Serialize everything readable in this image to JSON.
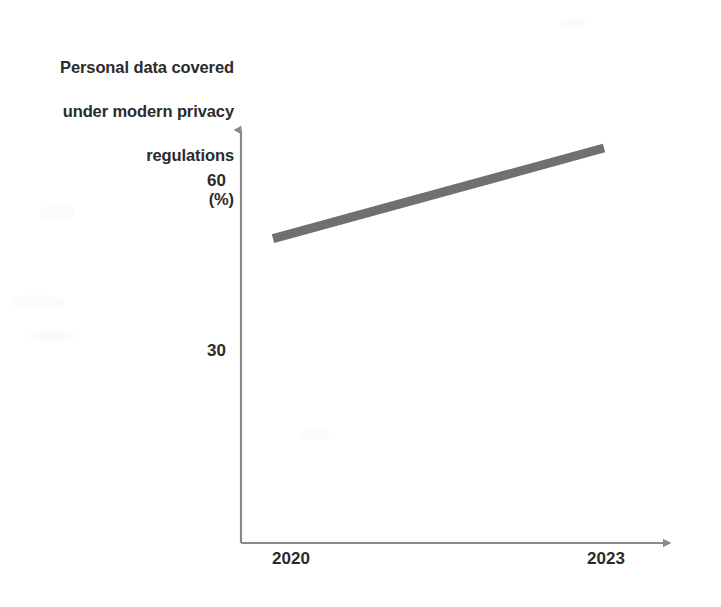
{
  "chart_data": {
    "type": "line",
    "title": "Personal data covered under modern privacy regulations (%)",
    "title_lines": [
      "Personal data covered",
      "under modern privacy",
      "regulations",
      "(%)"
    ],
    "xlabel": "",
    "ylabel": "Personal data covered under modern privacy regulations (%)",
    "categories": [
      "2020",
      "2023"
    ],
    "x": [
      2020,
      2023
    ],
    "values": [
      50,
      66
    ],
    "series": [
      {
        "name": "Personal data covered under modern privacy regulations (%)",
        "values": [
          50,
          66
        ],
        "color": "#707070"
      }
    ],
    "y_ticks": [
      30,
      60
    ],
    "y_tick_labels": [
      "30",
      "60"
    ],
    "x_tick_labels": [
      "2020",
      "2023"
    ],
    "ylim": [
      0,
      72
    ],
    "xlim": [
      2020,
      2023
    ],
    "grid": false,
    "legend": false,
    "legend_position": "none",
    "annotations": [],
    "axis_color": "#8a8a8a",
    "text_color": "#2b2b2b",
    "background": "#ffffff",
    "line_width_px": 9,
    "axis_arrows": [
      "up",
      "right"
    ]
  },
  "axis": {
    "y_tick_60": "60",
    "y_tick_30": "30",
    "x_tick_2020": "2020",
    "x_tick_2023": "2023"
  },
  "title": {
    "line1": "Personal data covered",
    "line2": "under modern privacy",
    "line3": "regulations",
    "line4": "(%)"
  }
}
